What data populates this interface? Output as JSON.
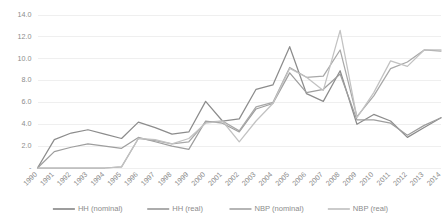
{
  "chart_data": {
    "type": "line",
    "title": "",
    "xlabel": "",
    "ylabel": "",
    "grid": true,
    "legend_position": "bottom",
    "ylim": [
      0,
      14
    ],
    "ytick_labels": [
      "14.0",
      "12.0",
      "10.0",
      "8.0",
      "6.0",
      "4.0",
      "2.0",
      "-"
    ],
    "ytick_values": [
      14.0,
      12.0,
      10.0,
      8.0,
      6.0,
      4.0,
      2.0,
      0
    ],
    "categories": [
      "1990",
      "1991",
      "1992",
      "1993",
      "1994",
      "1995",
      "1996",
      "1997",
      "1998",
      "1999",
      "2000",
      "2001",
      "2002",
      "2003",
      "2004",
      "2005",
      "2006",
      "2007",
      "2008",
      "2009",
      "2010",
      "2011",
      "2012",
      "2013",
      "2014"
    ],
    "series": [
      {
        "name": "HH (nominal)",
        "color": "#8c8c8c",
        "values": [
          0.0,
          2.6,
          3.2,
          3.5,
          3.1,
          2.7,
          4.2,
          3.7,
          3.1,
          3.3,
          6.1,
          4.3,
          4.5,
          7.2,
          7.6,
          11.1,
          6.8,
          6.1,
          8.9,
          4.0,
          4.9,
          4.3,
          2.8,
          3.7,
          4.6
        ]
      },
      {
        "name": "HH (real)",
        "color": "#9e9e9e",
        "values": [
          0.0,
          1.5,
          1.9,
          2.2,
          2.0,
          1.8,
          2.8,
          2.4,
          2.0,
          1.7,
          4.3,
          4.1,
          3.3,
          5.4,
          5.9,
          8.7,
          6.9,
          7.2,
          8.6,
          4.4,
          4.4,
          4.1,
          3.0,
          3.9,
          4.6
        ]
      },
      {
        "name": "NBP (nominal)",
        "color": "#a8a8a8",
        "values": [
          0.0,
          0.0,
          0.0,
          0.0,
          0.0,
          0.1,
          2.7,
          2.5,
          2.2,
          2.4,
          4.2,
          4.3,
          3.4,
          5.6,
          6.0,
          9.2,
          8.3,
          8.4,
          10.8,
          4.7,
          6.6,
          9.1,
          9.7,
          10.8,
          10.7
        ]
      },
      {
        "name": "NBP (real)",
        "color": "#c2c2c2",
        "values": [
          0.0,
          0.0,
          0.0,
          0.0,
          0.0,
          0.1,
          2.7,
          2.6,
          2.2,
          2.7,
          4.1,
          4.3,
          2.4,
          4.3,
          5.9,
          9.1,
          8.3,
          7.1,
          12.6,
          4.6,
          6.9,
          9.8,
          9.3,
          10.8,
          10.8
        ]
      }
    ]
  },
  "legend": {
    "entries": [
      "HH (nominal)",
      "HH (real)",
      "NBP (nominal)",
      "NBP (real)"
    ]
  },
  "axis": {
    "zero_label": "-"
  }
}
